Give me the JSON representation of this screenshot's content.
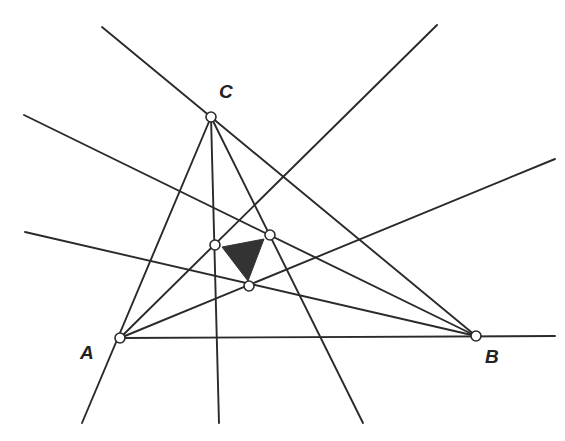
{
  "diagram": {
    "title": "",
    "vertices": [
      {
        "label": "A",
        "x": 120,
        "y": 338,
        "label_x": 80,
        "label_y": 359
      },
      {
        "label": "B",
        "x": 476,
        "y": 336,
        "label_x": 485,
        "label_y": 363
      },
      {
        "label": "C",
        "x": 211,
        "y": 117,
        "label_x": 219,
        "label_y": 98
      }
    ],
    "inner_points": [
      {
        "name": "P1",
        "x": 215,
        "y": 245
      },
      {
        "name": "P2",
        "x": 270,
        "y": 235
      },
      {
        "name": "P3",
        "x": 249,
        "y": 286
      }
    ],
    "shaded_triangle": {
      "points": "222,247 264,239 248,281",
      "color": "#333333"
    },
    "lines": [
      {
        "name": "line-ab",
        "x1": 120,
        "y1": 338,
        "x2": 555,
        "y2": 336
      },
      {
        "name": "line-ac",
        "x1": 82,
        "y1": 423,
        "x2": 211,
        "y2": 117
      },
      {
        "name": "line-c-extension",
        "x1": 211,
        "y1": 117,
        "x2": 102,
        "y2": 27
      },
      {
        "name": "line-cb",
        "x1": 211,
        "y1": 117,
        "x2": 476,
        "y2": 336
      },
      {
        "name": "line-a-p1",
        "x1": 120,
        "y1": 338,
        "x2": 437,
        "y2": 25
      },
      {
        "name": "line-a-p3",
        "x1": 120,
        "y1": 338,
        "x2": 555,
        "y2": 159
      },
      {
        "name": "line-b-p2",
        "x1": 476,
        "y1": 336,
        "x2": 24,
        "y2": 115
      },
      {
        "name": "line-b-p3",
        "x1": 476,
        "y1": 336,
        "x2": 25,
        "y2": 232
      },
      {
        "name": "line-c-p1",
        "x1": 211,
        "y1": 117,
        "x2": 219,
        "y2": 423
      },
      {
        "name": "line-c-p2",
        "x1": 211,
        "y1": 117,
        "x2": 363,
        "y2": 423
      }
    ],
    "colors": {
      "line": "#2a2a2a",
      "background": "#ffffff",
      "fill": "#333333"
    }
  }
}
